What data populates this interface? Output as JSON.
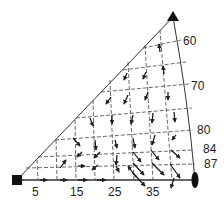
{
  "diagram": {
    "type": "ternary-like triangular vector field",
    "vertices": {
      "bottom_left": {
        "marker": "square",
        "x": 17,
        "y": 180
      },
      "top": {
        "marker": "triangle",
        "x": 173,
        "y": 17
      },
      "bottom_right": {
        "marker": "lens",
        "x": 195,
        "y": 180
      }
    },
    "bottom_axis_labels": [
      "5",
      "15",
      "25",
      "35"
    ],
    "right_edge_labels": [
      "60",
      "70",
      "80",
      "84",
      "87"
    ],
    "colors": {
      "line": "#222222",
      "background": "#ffffff"
    }
  }
}
